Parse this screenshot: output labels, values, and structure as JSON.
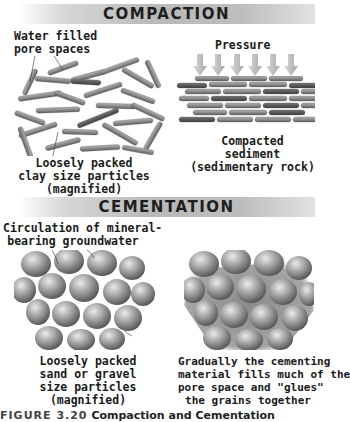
{
  "compaction": {
    "title": "COMPACTION",
    "left_label_top": [
      "Water filled",
      "pore spaces"
    ],
    "left_label_bottom": [
      "Loosely packed",
      "clay size particles",
      "(magnified)"
    ],
    "pressure_label": "Pressure",
    "right_label": [
      "Compacted",
      "sediment",
      "(sedimentary rock)"
    ],
    "pressure_arrow_count": 6
  },
  "cementation": {
    "title": "CEMENTATION",
    "left_label_top": [
      "Circulation of mineral-",
      "bearing groundwater"
    ],
    "left_label_bottom": [
      "Loosely packed",
      "sand or gravel",
      "size particles",
      "(magnified)"
    ],
    "right_label": [
      "Gradually the cementing",
      "material fills much of the",
      "pore space and \"glues\"",
      "the grains together"
    ]
  },
  "caption": {
    "figure_number": "FIGURE 3.20",
    "title": "Compaction and Cementation"
  },
  "colors": {
    "banner_mid": "#b9b9b9",
    "particle": "#8a8a8a",
    "grain": "#9a9a9a",
    "arrow": "#c4c4c4"
  }
}
